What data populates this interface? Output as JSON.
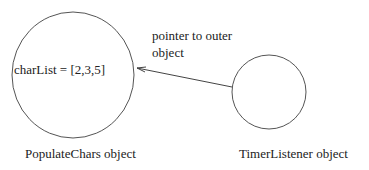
{
  "diagram": {
    "left_object": {
      "field_text": "charList = [2,3,5]",
      "caption": "PopulateChars object"
    },
    "right_object": {
      "caption": "TimerListener object"
    },
    "arrow": {
      "label_line1": "pointer to outer",
      "label_line2": "object"
    },
    "colors": {
      "stroke": "#555555",
      "text": "#222222"
    }
  }
}
